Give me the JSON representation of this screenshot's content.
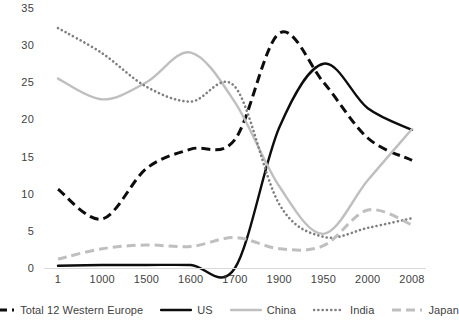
{
  "chart_data": {
    "type": "line",
    "title": "",
    "subtitle": "",
    "xlabel": "",
    "ylabel": "",
    "grid": false,
    "legend_position": "bottom",
    "categories": [
      "1",
      "1000",
      "1500",
      "1600",
      "1700",
      "1900",
      "1950",
      "2000",
      "2008"
    ],
    "x_tick_labels": [
      "1",
      "1000",
      "1500",
      "1600",
      "1700",
      "1900",
      "1950",
      "2000",
      "2008"
    ],
    "y_tick_labels": [
      "0",
      "5",
      "10",
      "15",
      "20",
      "25",
      "30",
      "35"
    ],
    "y_ticks": [
      0,
      5,
      10,
      15,
      20,
      25,
      30,
      35
    ],
    "ylim": [
      0,
      35
    ],
    "series": [
      {
        "name": "Total 12 Western Europe",
        "style": "dashed",
        "color": "#0d0d0d",
        "values": [
          10.6,
          6.6,
          13.4,
          16.0,
          17.3,
          31.6,
          25.0,
          17.5,
          14.5
        ]
      },
      {
        "name": "US",
        "style": "solid",
        "color": "#0d0d0d",
        "values": [
          0.3,
          0.4,
          0.4,
          0.4,
          0.0,
          18.9,
          27.5,
          21.5,
          18.6
        ]
      },
      {
        "name": "China",
        "style": "solid",
        "color": "#bfbfbf",
        "values": [
          25.5,
          22.7,
          25.0,
          29.0,
          22.3,
          11.0,
          4.6,
          11.8,
          18.7
        ]
      },
      {
        "name": "India",
        "style": "dotted",
        "color": "#7f7f7f",
        "values": [
          32.3,
          28.9,
          24.4,
          22.4,
          24.4,
          8.6,
          4.2,
          5.4,
          6.7
        ]
      },
      {
        "name": "Japan",
        "style": "dashed",
        "color": "#bfbfbf",
        "values": [
          1.2,
          2.6,
          3.1,
          2.9,
          4.1,
          2.6,
          3.0,
          7.8,
          5.8
        ]
      }
    ]
  },
  "legend": {
    "items": [
      {
        "label": "Total 12 Western Europe",
        "swatch": "dashed-black-line-swatch"
      },
      {
        "label": "US",
        "swatch": "solid-black-line-swatch"
      },
      {
        "label": "China",
        "swatch": "solid-gray-line-swatch"
      },
      {
        "label": "India",
        "swatch": "dotted-gray-line-swatch"
      },
      {
        "label": "Japan",
        "swatch": "dashed-lightgray-line-swatch"
      }
    ]
  }
}
